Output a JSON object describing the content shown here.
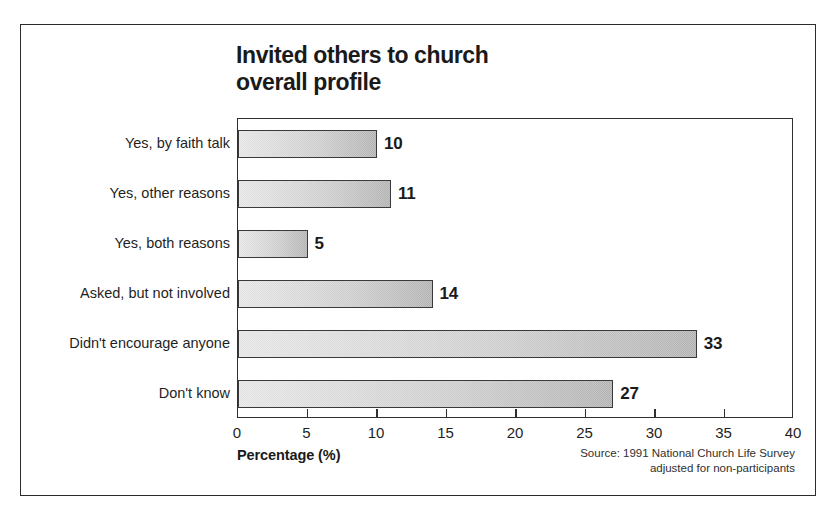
{
  "chart_data": {
    "type": "bar",
    "orientation": "horizontal",
    "title": "Invited others to church\noverall profile",
    "categories": [
      "Yes, by faith talk",
      "Yes, other reasons",
      "Yes, both reasons",
      "Asked, but not involved",
      "Didn't encourage anyone",
      "Don't know"
    ],
    "values": [
      10,
      11,
      5,
      14,
      33,
      27
    ],
    "value_labels": [
      "10",
      "11",
      "5",
      "14",
      "33",
      "27"
    ],
    "xlabel": "Percentage (%)",
    "ylabel": "",
    "xlim": [
      0,
      40
    ],
    "xticks": [
      0,
      5,
      10,
      15,
      20,
      25,
      30,
      35,
      40
    ],
    "xtick_labels": [
      "0",
      "5",
      "10",
      "15",
      "20",
      "25",
      "30",
      "35",
      "40"
    ],
    "grid": false,
    "legend": false,
    "legend_position": "none",
    "source_note": "Source: 1991 National Church Life Survey\nadjusted for non-participants",
    "colors": {
      "bar_fill_light": "#d2d2d2",
      "bar_fill_dark": "#7c7c7c",
      "bar_outline": "#3a3a3a",
      "axis": "#303030",
      "text": "#1a1a1a",
      "frame": "#2b2b2b",
      "background": "#ffffff"
    }
  }
}
